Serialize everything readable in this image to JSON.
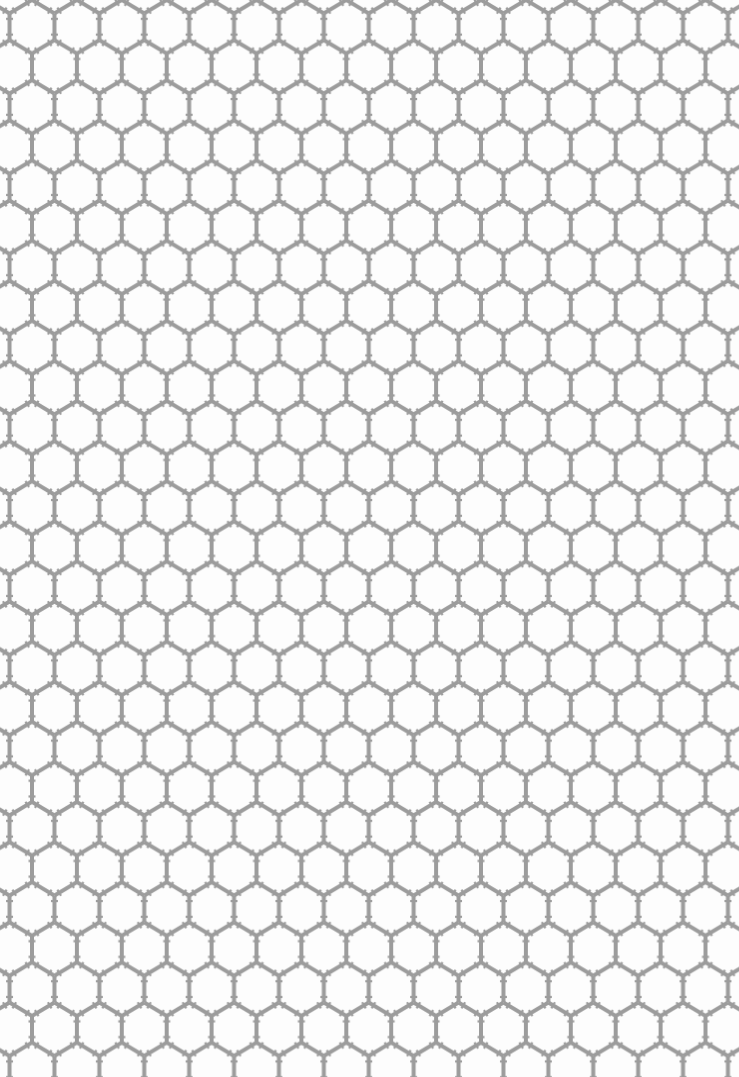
{
  "image": {
    "title": "Hexagonal lattice pattern",
    "width": 739,
    "height": 1077,
    "background_color": "#fdfdfd"
  },
  "pattern": {
    "type": "pointy-top hexagon lattice with asterisk vertex marks",
    "line_color": "#9c9c9c",
    "line_width": 4,
    "tick_width": 2.2,
    "tick_length": 5,
    "horizontal_period": 44.9,
    "vertical_period": 80.2,
    "offset_x": 32,
    "offset_y": 0
  }
}
